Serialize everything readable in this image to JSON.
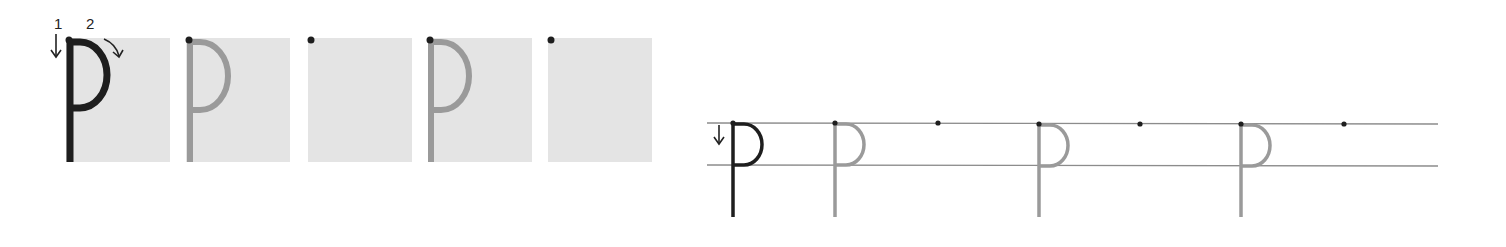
{
  "worksheet": {
    "letter": "p",
    "stroke_labels": [
      "1",
      "2"
    ],
    "colors": {
      "model_stroke": "#1e1e1e",
      "trace_stroke": "#9a9a9a",
      "box_fill": "#e4e4e4",
      "guide_line": "#8c8c8c",
      "start_dot": "#1e1e1e"
    },
    "left_panel": {
      "boxes": [
        {
          "type": "model",
          "x": 66
        },
        {
          "type": "trace",
          "x": 186
        },
        {
          "type": "blank",
          "x": 308
        },
        {
          "type": "trace",
          "x": 428
        },
        {
          "type": "blank",
          "x": 548
        }
      ]
    },
    "right_panel": {
      "lines_y": [
        123,
        165
      ],
      "line_x_range": [
        707,
        1438
      ],
      "letters": [
        {
          "type": "model",
          "x": 733
        },
        {
          "type": "trace",
          "x": 835
        },
        {
          "type": "dot",
          "x": 938
        },
        {
          "type": "trace",
          "x": 1039
        },
        {
          "type": "dot",
          "x": 1140
        },
        {
          "type": "trace",
          "x": 1241
        },
        {
          "type": "dot",
          "x": 1344
        }
      ]
    }
  }
}
